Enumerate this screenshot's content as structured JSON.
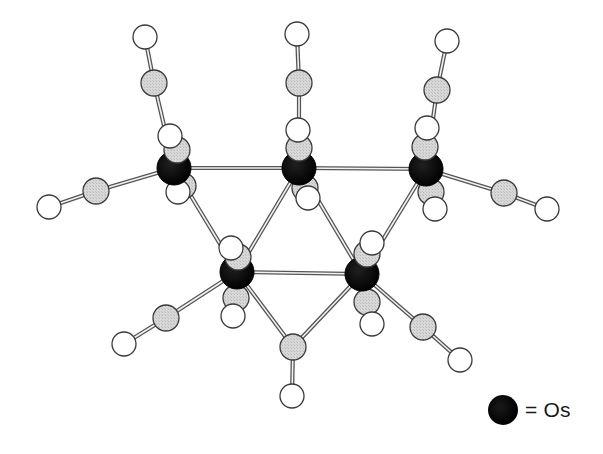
{
  "diagram": {
    "type": "ball-and-stick molecular structure",
    "colors": {
      "os_fill": "#0a0a0a",
      "c_fill": "#d4d4d4",
      "o_fill": "#ffffff",
      "outline": "#3a3a3a",
      "bond": "#555555"
    },
    "radii": {
      "Os": 17,
      "C": 13,
      "O": 12
    },
    "atoms": [
      {
        "id": "C1a",
        "el": "C",
        "x": 154,
        "y": 83
      },
      {
        "id": "O1a",
        "el": "O",
        "x": 145,
        "y": 37
      },
      {
        "id": "C1d",
        "el": "C",
        "x": 183,
        "y": 186
      },
      {
        "id": "O1d",
        "el": "O",
        "x": 178,
        "y": 192
      },
      {
        "id": "C1l",
        "el": "C",
        "x": 96,
        "y": 191
      },
      {
        "id": "O1l",
        "el": "O",
        "x": 49,
        "y": 207
      },
      {
        "id": "C2a",
        "el": "C",
        "x": 299,
        "y": 83
      },
      {
        "id": "O2a",
        "el": "O",
        "x": 297,
        "y": 34
      },
      {
        "id": "C2d",
        "el": "C",
        "x": 305,
        "y": 188
      },
      {
        "id": "O2d",
        "el": "O",
        "x": 308,
        "y": 198
      },
      {
        "id": "C3a",
        "el": "C",
        "x": 437,
        "y": 90
      },
      {
        "id": "O3a",
        "el": "O",
        "x": 447,
        "y": 41
      },
      {
        "id": "C3d",
        "el": "C",
        "x": 431,
        "y": 192
      },
      {
        "id": "O3d",
        "el": "O",
        "x": 435,
        "y": 209
      },
      {
        "id": "C3r",
        "el": "C",
        "x": 504,
        "y": 193
      },
      {
        "id": "O3r",
        "el": "O",
        "x": 547,
        "y": 209
      },
      {
        "id": "C4d",
        "el": "C",
        "x": 236,
        "y": 298
      },
      {
        "id": "O4d",
        "el": "O",
        "x": 233,
        "y": 316
      },
      {
        "id": "C4l",
        "el": "C",
        "x": 166,
        "y": 318
      },
      {
        "id": "O4l",
        "el": "O",
        "x": 124,
        "y": 344
      },
      {
        "id": "C5d",
        "el": "C",
        "x": 367,
        "y": 302
      },
      {
        "id": "O5d",
        "el": "O",
        "x": 372,
        "y": 324
      },
      {
        "id": "C5r",
        "el": "C",
        "x": 423,
        "y": 327
      },
      {
        "id": "O5r",
        "el": "O",
        "x": 460,
        "y": 360
      },
      {
        "id": "Cb",
        "el": "C",
        "x": 293,
        "y": 347
      },
      {
        "id": "Ob",
        "el": "O",
        "x": 292,
        "y": 396
      },
      {
        "id": "Os1",
        "el": "Os",
        "x": 174,
        "y": 168
      },
      {
        "id": "Os2",
        "el": "Os",
        "x": 299,
        "y": 168
      },
      {
        "id": "Os3",
        "el": "Os",
        "x": 426,
        "y": 169
      },
      {
        "id": "Os4",
        "el": "Os",
        "x": 237,
        "y": 272
      },
      {
        "id": "Os5",
        "el": "Os",
        "x": 362,
        "y": 274
      },
      {
        "id": "C1f",
        "el": "C",
        "x": 177,
        "y": 150
      },
      {
        "id": "O1f",
        "el": "O",
        "x": 170,
        "y": 136
      },
      {
        "id": "C2f",
        "el": "C",
        "x": 299,
        "y": 148
      },
      {
        "id": "O2f",
        "el": "O",
        "x": 298,
        "y": 130
      },
      {
        "id": "C3f",
        "el": "C",
        "x": 425,
        "y": 147
      },
      {
        "id": "O3f",
        "el": "O",
        "x": 427,
        "y": 128
      },
      {
        "id": "C4f",
        "el": "C",
        "x": 238,
        "y": 257
      },
      {
        "id": "O4f",
        "el": "O",
        "x": 231,
        "y": 248
      },
      {
        "id": "C5f",
        "el": "C",
        "x": 367,
        "y": 254
      },
      {
        "id": "O5f",
        "el": "O",
        "x": 372,
        "y": 243
      }
    ],
    "bonds": [
      [
        "Os1",
        "Os2"
      ],
      [
        "Os2",
        "Os3"
      ],
      [
        "Os4",
        "Os5"
      ],
      [
        "Os1",
        "Os4"
      ],
      [
        "Os2",
        "Os4"
      ],
      [
        "Os2",
        "Os5"
      ],
      [
        "Os3",
        "Os5"
      ],
      [
        "Os4",
        "Cb"
      ],
      [
        "Os5",
        "Cb"
      ],
      [
        "Cb",
        "Ob"
      ],
      [
        "Os1",
        "C1a"
      ],
      [
        "C1a",
        "O1a"
      ],
      [
        "Os1",
        "C1l"
      ],
      [
        "C1l",
        "O1l"
      ],
      [
        "Os2",
        "C2a"
      ],
      [
        "C2a",
        "O2a"
      ],
      [
        "Os3",
        "C3a"
      ],
      [
        "C3a",
        "O3a"
      ],
      [
        "Os3",
        "C3r"
      ],
      [
        "C3r",
        "O3r"
      ],
      [
        "Os4",
        "C4l"
      ],
      [
        "C4l",
        "O4l"
      ],
      [
        "Os5",
        "C5r"
      ],
      [
        "C5r",
        "O5r"
      ]
    ]
  },
  "legend": {
    "symbol": "black-sphere",
    "label": "= Os"
  }
}
